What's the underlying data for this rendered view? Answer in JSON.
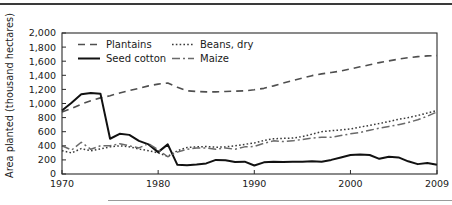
{
  "figure": {
    "background_color": "#ffffff",
    "line_color": "#2b2b2b",
    "top_rule": true,
    "bottom_rule": true
  },
  "chart_data": {
    "type": "line",
    "title": "",
    "subtitle": "",
    "xlabel": "",
    "ylabel": "Area planted (thousand hectares)",
    "xlim": [
      1970,
      2009
    ],
    "ylim": [
      0,
      2000
    ],
    "grid": false,
    "legend_position": "top-left-inside",
    "x_ticks": [
      1970,
      1980,
      1990,
      2000,
      2009
    ],
    "x_tick_labels": [
      "1970",
      "1980",
      "1990",
      "2000",
      "2009"
    ],
    "y_ticks": [
      0,
      200,
      400,
      600,
      800,
      1000,
      1200,
      1400,
      1600,
      1800,
      2000
    ],
    "y_tick_labels": [
      "0",
      "200",
      "400",
      "600",
      "800",
      "1,000",
      "1,200",
      "1,400",
      "1,600",
      "1,800",
      "2,000"
    ],
    "x": [
      1970,
      1971,
      1972,
      1973,
      1974,
      1975,
      1976,
      1977,
      1978,
      1979,
      1980,
      1981,
      1982,
      1983,
      1984,
      1985,
      1986,
      1987,
      1988,
      1989,
      1990,
      1991,
      1992,
      1993,
      1994,
      1995,
      1996,
      1997,
      1998,
      1999,
      2000,
      2001,
      2002,
      2003,
      2004,
      2005,
      2006,
      2007,
      2008,
      2009
    ],
    "series": [
      {
        "name": "Plantains",
        "key": "plantains",
        "style": "dashed",
        "dash": "7,5",
        "width": 1.6,
        "color": "#4f4f4f",
        "values": [
          880,
          930,
          990,
          1040,
          1080,
          1110,
          1150,
          1185,
          1215,
          1250,
          1275,
          1290,
          1230,
          1180,
          1170,
          1165,
          1165,
          1170,
          1175,
          1180,
          1195,
          1215,
          1250,
          1290,
          1325,
          1360,
          1395,
          1420,
          1440,
          1460,
          1490,
          1520,
          1550,
          1580,
          1605,
          1630,
          1650,
          1665,
          1675,
          1680
        ]
      },
      {
        "name": "Beans, dry",
        "key": "beans_dry",
        "style": "dotted",
        "dash": "1.6,2.2",
        "width": 1.5,
        "color": "#3a3a3a",
        "values": [
          330,
          300,
          360,
          330,
          355,
          385,
          400,
          385,
          355,
          330,
          300,
          250,
          330,
          375,
          385,
          390,
          380,
          385,
          400,
          420,
          440,
          475,
          500,
          505,
          510,
          530,
          565,
          600,
          615,
          625,
          640,
          665,
          690,
          715,
          745,
          775,
          800,
          830,
          865,
          900
        ]
      },
      {
        "name": "Seed cotton",
        "key": "seed_cotton",
        "style": "solid",
        "dash": "none",
        "width": 2.0,
        "color": "#111111",
        "values": [
          900,
          1010,
          1130,
          1150,
          1140,
          500,
          570,
          555,
          470,
          420,
          310,
          420,
          130,
          125,
          135,
          150,
          200,
          195,
          170,
          175,
          120,
          165,
          175,
          170,
          175,
          175,
          180,
          175,
          200,
          235,
          270,
          275,
          270,
          215,
          245,
          235,
          180,
          140,
          155,
          130
        ]
      },
      {
        "name": "Maize",
        "key": "maize",
        "style": "dashdot",
        "dash": "8,3,2,3",
        "width": 1.5,
        "color": "#6a6a6a",
        "values": [
          400,
          340,
          450,
          350,
          400,
          400,
          430,
          400,
          370,
          430,
          345,
          245,
          310,
          350,
          370,
          370,
          350,
          370,
          350,
          385,
          390,
          435,
          470,
          460,
          470,
          490,
          510,
          520,
          520,
          545,
          570,
          590,
          620,
          650,
          675,
          700,
          730,
          770,
          820,
          880
        ]
      }
    ]
  },
  "legend": {
    "entries": [
      {
        "label": "Plantains",
        "key": "plantains"
      },
      {
        "label": "Beans, dry",
        "key": "beans_dry"
      },
      {
        "label": "Seed cotton",
        "key": "seed_cotton"
      },
      {
        "label": "Maize",
        "key": "maize"
      }
    ]
  }
}
